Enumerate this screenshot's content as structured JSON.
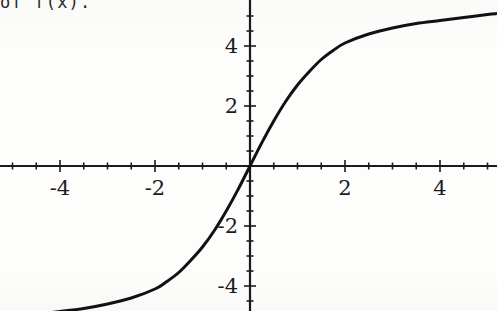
{
  "caption": {
    "text": "of f(x)."
  },
  "colors": {
    "background": "#fdfdfc",
    "ink": "#1c1c1c",
    "curve": "#111111",
    "axis": "#1a1a1a"
  },
  "chart_data": {
    "type": "line",
    "title": "",
    "subtitle": "",
    "xlabel": "",
    "ylabel": "",
    "xlim": [
      -5.25,
      5.2
    ],
    "ylim": [
      -5.2,
      5.35
    ],
    "grid": false,
    "legend": null,
    "axis_style": "centered-cross",
    "x_ticks_major": [
      -4,
      -2,
      2,
      4
    ],
    "x_tick_labels": [
      "-4",
      "-2",
      "2",
      "4"
    ],
    "x_ticks_minor": [
      -5,
      -4.5,
      -3.5,
      -3,
      -2.5,
      -1.5,
      -1,
      -0.5,
      0.5,
      1,
      1.5,
      2.5,
      3,
      3.5,
      4.5,
      5
    ],
    "y_ticks_major": [
      -4,
      -2,
      2,
      4
    ],
    "y_tick_labels": [
      "-4",
      "-2",
      "2",
      "4"
    ],
    "y_ticks_minor": [
      -5,
      -4.5,
      -3.5,
      -3,
      -2.5,
      -1.5,
      -1,
      -0.5,
      0.5,
      1,
      1.5,
      2.5,
      3,
      3.5,
      4.5,
      5
    ],
    "series": [
      {
        "name": "f(x)",
        "description": "sigmoid / hyperbolic-tangent shaped curve with horizontal asymptotes near y = +5 and y = -5",
        "x": [
          -5.25,
          -5.0,
          -4.5,
          -4.0,
          -3.5,
          -3.0,
          -2.5,
          -2.0,
          -1.75,
          -1.5,
          -1.25,
          -1.0,
          -0.75,
          -0.5,
          -0.25,
          0.0,
          0.25,
          0.5,
          0.75,
          1.0,
          1.25,
          1.5,
          1.75,
          2.0,
          2.5,
          3.0,
          3.5,
          4.0,
          4.5,
          5.0,
          5.2
        ],
        "y": [
          -5.15,
          -5.05,
          -4.95,
          -4.85,
          -4.75,
          -4.6,
          -4.4,
          -4.1,
          -3.85,
          -3.55,
          -3.15,
          -2.7,
          -2.15,
          -1.5,
          -0.78,
          0.0,
          0.78,
          1.5,
          2.15,
          2.7,
          3.15,
          3.55,
          3.85,
          4.1,
          4.4,
          4.6,
          4.75,
          4.85,
          4.95,
          5.05,
          5.08
        ]
      }
    ],
    "annotations": []
  },
  "axes_geometry": {
    "origin_x_px": 250,
    "origin_y_px": 166,
    "px_per_unit_x": 47.5,
    "px_per_unit_y": 30.0
  }
}
